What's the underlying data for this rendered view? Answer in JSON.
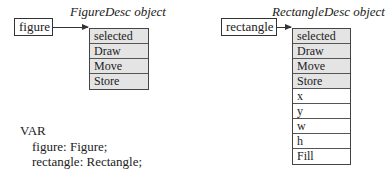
{
  "left": {
    "variable": "figure",
    "object_title": "FigureDesc object",
    "fields": [
      {
        "label": "selected",
        "shaded": true
      },
      {
        "label": "Draw",
        "shaded": true
      },
      {
        "label": "Move",
        "shaded": true
      },
      {
        "label": "Store",
        "shaded": true
      }
    ]
  },
  "right": {
    "variable": "rectangle",
    "object_title": "RectangleDesc object",
    "fields": [
      {
        "label": "selected",
        "shaded": true
      },
      {
        "label": "Draw",
        "shaded": true
      },
      {
        "label": "Move",
        "shaded": true
      },
      {
        "label": "Store",
        "shaded": true
      },
      {
        "label": "x",
        "shaded": false
      },
      {
        "label": "y",
        "shaded": false
      },
      {
        "label": "w",
        "shaded": false
      },
      {
        "label": "h",
        "shaded": false
      },
      {
        "label": "Fill",
        "shaded": false
      }
    ]
  },
  "code": {
    "keyword": "VAR",
    "lines": [
      "figure: Figure;",
      "rectangle: Rectangle;"
    ]
  },
  "colors": {
    "shaded_fill": "#e4e4e4",
    "line": "#333333"
  }
}
